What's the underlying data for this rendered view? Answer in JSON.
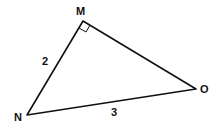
{
  "diagram": {
    "type": "right-triangle",
    "vertices": [
      {
        "name": "M",
        "x": 83,
        "y": 21
      },
      {
        "name": "N",
        "x": 27,
        "y": 115
      },
      {
        "name": "O",
        "x": 196,
        "y": 89
      }
    ],
    "right_angle_at": "M",
    "sides": [
      {
        "from": "M",
        "to": "N",
        "label": "2"
      },
      {
        "from": "N",
        "to": "O",
        "label": "3"
      },
      {
        "from": "M",
        "to": "O",
        "label": ""
      }
    ],
    "labels": {
      "M": "M",
      "N": "N",
      "O": "O",
      "MN": "2",
      "NO": "3"
    },
    "stroke_color": "#111111"
  }
}
